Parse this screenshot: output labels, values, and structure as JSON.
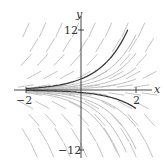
{
  "diagram": {
    "type": "slope-field",
    "equation_depicted": "y' = y",
    "axes": {
      "x_label": "x",
      "y_label": "y",
      "x_ticks": [
        {
          "value": -2,
          "label": "−2"
        },
        {
          "value": 2,
          "label": "2"
        }
      ],
      "y_ticks": [
        {
          "value": 12,
          "label": "12"
        },
        {
          "value": -12,
          "label": "−12"
        }
      ],
      "x_range": [
        -2.9,
        2.9
      ],
      "y_range": [
        -14,
        15
      ]
    },
    "highlighted_solutions_C": [
      2.2,
      -0.5
    ],
    "light_solutions_C": [
      1.5,
      1.0,
      0.6,
      0.3,
      -1.0,
      -1.6,
      -2.4,
      -3.4
    ],
    "colors": {
      "axis": "#333333",
      "highlight_curve": "#3a3a3a",
      "light_curve": "#bdbdbd",
      "slope_mark": "#c4c4c4"
    }
  }
}
